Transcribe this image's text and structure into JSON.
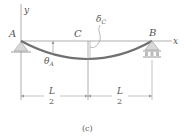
{
  "diagram": {
    "type": "simply-supported beam deflection",
    "labels": {
      "y_axis": "y",
      "x_axis": "x",
      "support_a": "A",
      "point_c": "C",
      "support_b": "B",
      "theta_a": "θ",
      "theta_a_sub": "A",
      "delta_c": "δ",
      "delta_c_sub": "C",
      "left_span_num": "L",
      "left_span_den": "2",
      "right_span_num": "L",
      "right_span_den": "2",
      "caption": "(c)"
    },
    "colors": {
      "line": "#9a9a9a",
      "beam_curve": "#707070",
      "support_fill": "#d8d8d8",
      "text": "#555555"
    }
  }
}
